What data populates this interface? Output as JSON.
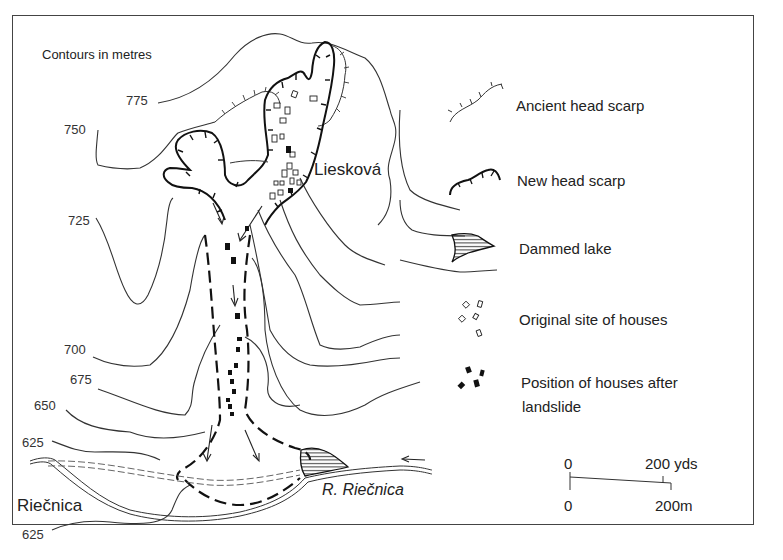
{
  "map": {
    "title_note": "Contours in metres",
    "contour_labels": [
      {
        "id": "c775",
        "value": "775",
        "x": 126,
        "y": 93
      },
      {
        "id": "c750",
        "value": "750",
        "x": 64,
        "y": 122
      },
      {
        "id": "c725",
        "value": "725",
        "x": 68,
        "y": 213
      },
      {
        "id": "c700",
        "value": "700",
        "x": 64,
        "y": 342
      },
      {
        "id": "c675",
        "value": "675",
        "x": 70,
        "y": 372
      },
      {
        "id": "c650",
        "value": "650",
        "x": 34,
        "y": 398
      },
      {
        "id": "c625a",
        "value": "625",
        "x": 22,
        "y": 435
      },
      {
        "id": "c625b",
        "value": "625",
        "x": 22,
        "y": 527
      }
    ],
    "places": {
      "village": "Liesková",
      "town": "Riečnica",
      "river": "R. Riečnica"
    }
  },
  "legend": {
    "items": [
      {
        "icon": "ancient-head-scarp-icon",
        "label": "Ancient head scarp"
      },
      {
        "icon": "new-head-scarp-icon",
        "label": "New head scarp"
      },
      {
        "icon": "dammed-lake-icon",
        "label": "Dammed lake"
      },
      {
        "icon": "original-houses-icon",
        "label": "Original site of houses"
      },
      {
        "icon": "moved-houses-icon",
        "label": "Position of houses after",
        "label2": "landslide"
      }
    ]
  },
  "scale_bar": {
    "top_start": "0",
    "top_end": "200 yds",
    "bottom_start": "0",
    "bottom_end": "200m"
  }
}
